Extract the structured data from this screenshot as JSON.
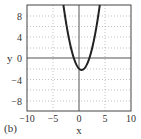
{
  "panel_label": "(b)",
  "chart_data": {
    "type": "line",
    "title": "",
    "xlabel": "x",
    "ylabel": "y",
    "xlim": [
      -10,
      10
    ],
    "ylim": [
      -10,
      10
    ],
    "x_ticks": [
      -10,
      -5,
      0,
      5,
      10
    ],
    "y_ticks": [
      -8,
      -4,
      0,
      4,
      8
    ],
    "grid": true,
    "legend": null,
    "series": [
      {
        "name": "y = x^2 - x - 2",
        "color": "#222222",
        "x": [
          -3,
          -2.5,
          -2,
          -1.5,
          -1,
          -0.5,
          0,
          0.5,
          1,
          1.5,
          2,
          2.5,
          3,
          3.5,
          4
        ],
        "y": [
          10,
          6.75,
          4,
          1.75,
          0,
          -1.25,
          -2,
          -2.25,
          -2,
          -1.25,
          0,
          1.75,
          4,
          6.75,
          10
        ]
      }
    ]
  },
  "labels": {
    "x_ticks": [
      "−10",
      "−5",
      "0",
      "5",
      "10"
    ],
    "y_ticks": [
      "8",
      "4",
      "0",
      "−4",
      "−8"
    ],
    "xlabel": "x",
    "ylabel": "y"
  }
}
